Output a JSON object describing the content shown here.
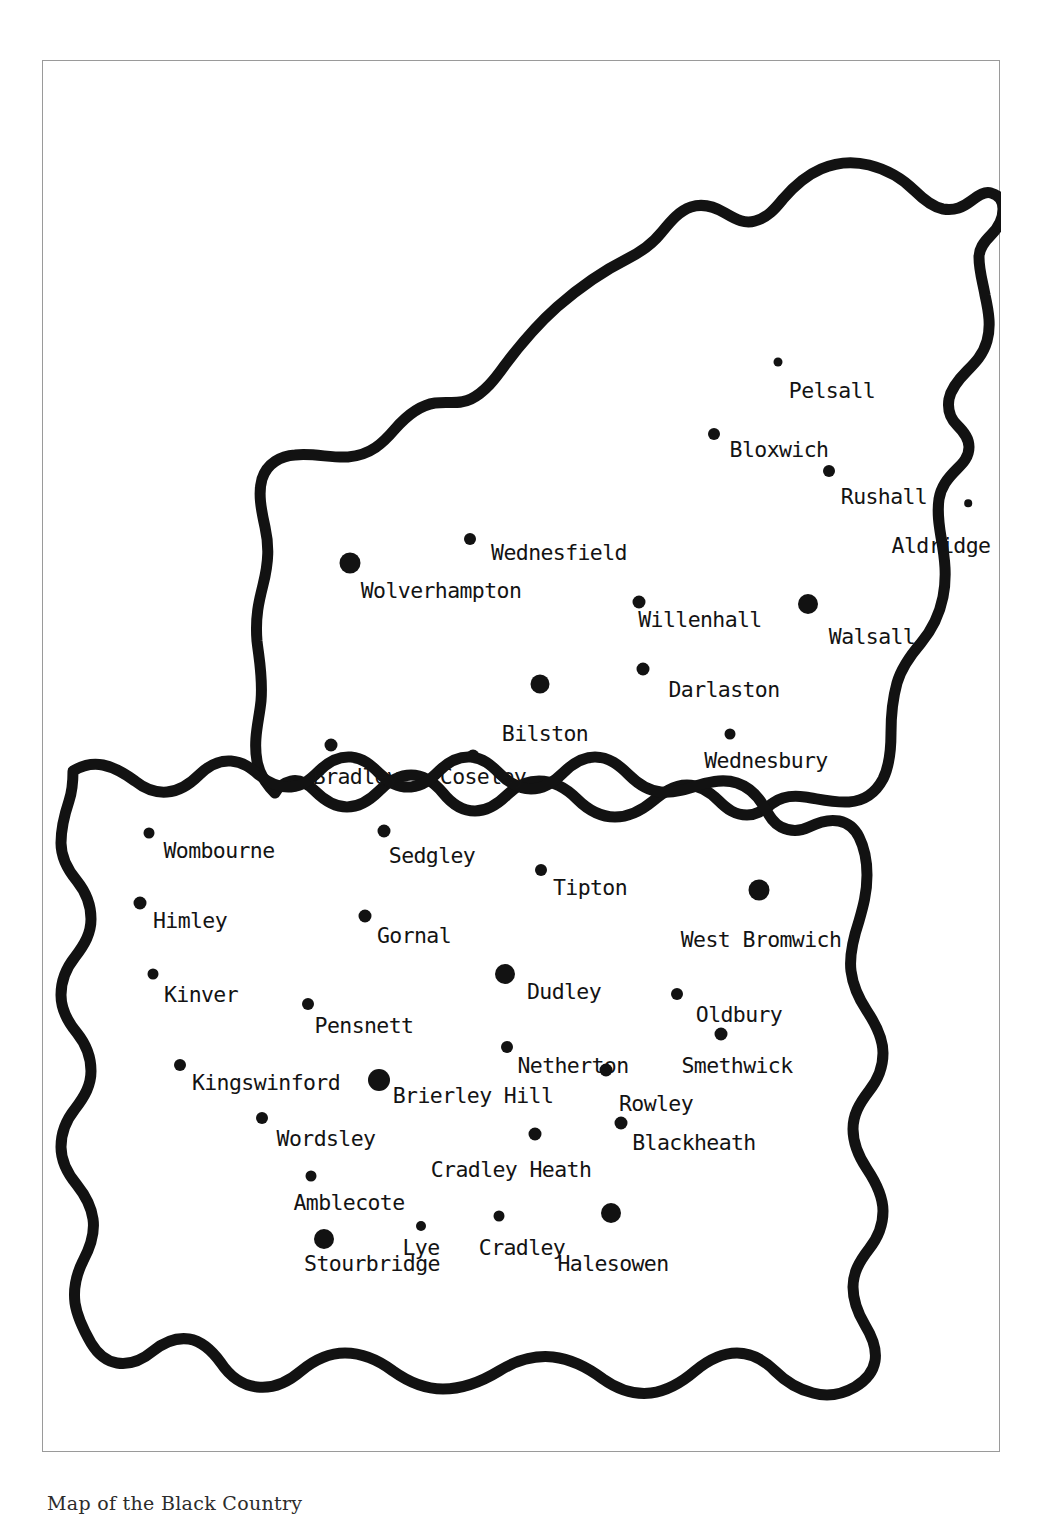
{
  "caption": "Map of the Black Country",
  "frame": {
    "border_color": "#9a9a9a",
    "background": "#ffffff"
  },
  "map": {
    "title": "Map of the Black Country",
    "outline_color": "#121212",
    "dot_color": "#121212",
    "label_color": "#131313",
    "region_names": [
      "Black Country"
    ],
    "places": [
      {
        "name": "Pelsall",
        "dot_x": 735,
        "dot_y": 301,
        "dot_r": 4.5,
        "label_x": 789,
        "label_y": 319
      },
      {
        "name": "Bloxwich",
        "dot_x": 671,
        "dot_y": 373,
        "dot_r": 6.0,
        "label_x": 736,
        "label_y": 378
      },
      {
        "name": "Rushall",
        "dot_x": 786,
        "dot_y": 410,
        "dot_r": 6.0,
        "label_x": 841,
        "label_y": 425
      },
      {
        "name": "Aldridge",
        "dot_x": 925,
        "dot_y": 442,
        "dot_r": 3.8,
        "label_x": 898,
        "label_y": 474
      },
      {
        "name": "Wednesfield",
        "dot_x": 427,
        "dot_y": 478,
        "dot_r": 6.0,
        "label_x": 516,
        "label_y": 481
      },
      {
        "name": "Wolverhampton",
        "dot_x": 307,
        "dot_y": 502,
        "dot_r": 10.5,
        "label_x": 398,
        "label_y": 519
      },
      {
        "name": "Willenhall",
        "dot_x": 596,
        "dot_y": 541,
        "dot_r": 6.5,
        "label_x": 657,
        "label_y": 548
      },
      {
        "name": "Walsall",
        "dot_x": 765,
        "dot_y": 543,
        "dot_r": 10.0,
        "label_x": 829,
        "label_y": 565
      },
      {
        "name": "Darlaston",
        "dot_x": 600,
        "dot_y": 608,
        "dot_r": 6.5,
        "label_x": 681,
        "label_y": 618
      },
      {
        "name": "Bilston",
        "dot_x": 497,
        "dot_y": 623,
        "dot_r": 9.5,
        "label_x": 502,
        "label_y": 662
      },
      {
        "name": "Wednesbury",
        "dot_x": 687,
        "dot_y": 673,
        "dot_r": 5.5,
        "label_x": 723,
        "label_y": 689
      },
      {
        "name": "Bradley",
        "dot_x": 288,
        "dot_y": 684,
        "dot_r": 6.5,
        "label_x": 313,
        "label_y": 705
      },
      {
        "name": "Coseley",
        "dot_x": 430,
        "dot_y": 695,
        "dot_r": 6.5,
        "label_x": 440,
        "label_y": 705
      },
      {
        "name": "Wombourne",
        "dot_x": 106,
        "dot_y": 772,
        "dot_r": 5.5,
        "label_x": 176,
        "label_y": 779
      },
      {
        "name": "Sedgley",
        "dot_x": 341,
        "dot_y": 770,
        "dot_r": 6.5,
        "label_x": 389,
        "label_y": 784
      },
      {
        "name": "Tipton",
        "dot_x": 498,
        "dot_y": 809,
        "dot_r": 6.0,
        "label_x": 547,
        "label_y": 816
      },
      {
        "name": "West Bromwich",
        "dot_x": 716,
        "dot_y": 829,
        "dot_r": 10.5,
        "label_x": 718,
        "label_y": 868
      },
      {
        "name": "Himley",
        "dot_x": 97,
        "dot_y": 842,
        "dot_r": 6.5,
        "label_x": 147,
        "label_y": 849
      },
      {
        "name": "Gornal",
        "dot_x": 322,
        "dot_y": 855,
        "dot_r": 6.5,
        "label_x": 371,
        "label_y": 864
      },
      {
        "name": "Dudley",
        "dot_x": 462,
        "dot_y": 913,
        "dot_r": 10.0,
        "label_x": 521,
        "label_y": 920
      },
      {
        "name": "Kinver",
        "dot_x": 110,
        "dot_y": 913,
        "dot_r": 5.5,
        "label_x": 158,
        "label_y": 923
      },
      {
        "name": "Oldbury",
        "dot_x": 634,
        "dot_y": 933,
        "dot_r": 6.0,
        "label_x": 696,
        "label_y": 943
      },
      {
        "name": "Pensnett",
        "dot_x": 265,
        "dot_y": 943,
        "dot_r": 6.0,
        "label_x": 321,
        "label_y": 954
      },
      {
        "name": "Netherton",
        "dot_x": 464,
        "dot_y": 986,
        "dot_r": 6.0,
        "label_x": 530,
        "label_y": 994
      },
      {
        "name": "Smethwick",
        "dot_x": 678,
        "dot_y": 973,
        "dot_r": 6.5,
        "label_x": 694,
        "label_y": 994
      },
      {
        "name": "Kingswinford",
        "dot_x": 137,
        "dot_y": 1004,
        "dot_r": 6.0,
        "label_x": 223,
        "label_y": 1011
      },
      {
        "name": "Brierley Hill",
        "dot_x": 336,
        "dot_y": 1019,
        "dot_r": 11.0,
        "label_x": 430,
        "label_y": 1024
      },
      {
        "name": "Rowley",
        "dot_x": 563,
        "dot_y": 1009,
        "dot_r": 6.5,
        "label_x": 613,
        "label_y": 1032
      },
      {
        "name": "Wordsley",
        "dot_x": 219,
        "dot_y": 1057,
        "dot_r": 6.0,
        "label_x": 283,
        "label_y": 1067
      },
      {
        "name": "Blackheath",
        "dot_x": 578,
        "dot_y": 1062,
        "dot_r": 6.5,
        "label_x": 651,
        "label_y": 1071
      },
      {
        "name": "Cradley Heath",
        "dot_x": 492,
        "dot_y": 1073,
        "dot_r": 6.5,
        "label_x": 468,
        "label_y": 1098
      },
      {
        "name": "Amblecote",
        "dot_x": 268,
        "dot_y": 1115,
        "dot_r": 5.5,
        "label_x": 306,
        "label_y": 1131
      },
      {
        "name": "Halesowen",
        "dot_x": 568,
        "dot_y": 1152,
        "dot_r": 10.0,
        "label_x": 570,
        "label_y": 1192
      },
      {
        "name": "Cradley",
        "dot_x": 456,
        "dot_y": 1155,
        "dot_r": 5.5,
        "label_x": 479,
        "label_y": 1176
      },
      {
        "name": "Lye",
        "dot_x": 378,
        "dot_y": 1165,
        "dot_r": 5.0,
        "label_x": 378,
        "label_y": 1176
      },
      {
        "name": "Stourbridge",
        "dot_x": 281,
        "dot_y": 1178,
        "dot_r": 10.0,
        "label_x": 329,
        "label_y": 1192
      }
    ]
  }
}
